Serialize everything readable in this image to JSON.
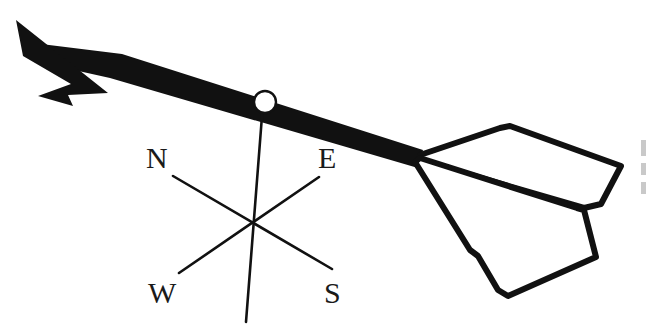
{
  "figure": {
    "background_color": "#ffffff",
    "ink_color": "#111111",
    "width": 649,
    "height": 328
  },
  "compass": {
    "center": {
      "x": 250,
      "y": 222
    },
    "labels": [
      {
        "id": "north",
        "text": "N",
        "x": 146,
        "y": 168
      },
      {
        "id": "east",
        "text": "E",
        "x": 318,
        "y": 168
      },
      {
        "id": "west",
        "text": "W",
        "x": 148,
        "y": 303
      },
      {
        "id": "south",
        "text": "S",
        "x": 324,
        "y": 303
      }
    ],
    "spokes": [
      {
        "id": "pole",
        "x1": 263,
        "y1": 103,
        "x2": 246,
        "y2": 322,
        "width": 2.6
      },
      {
        "id": "north-south-diagonal",
        "x1": 173,
        "y1": 176,
        "x2": 332,
        "y2": 269,
        "width": 2.6
      },
      {
        "id": "east-west-diagonal",
        "x1": 319,
        "y1": 177,
        "x2": 179,
        "y2": 273,
        "width": 2.6
      }
    ]
  },
  "arrow": {
    "shaft": {
      "points": "41,44 122,54 423,150 418,168 110,78 38,62",
      "color": "#111111"
    },
    "head": {
      "points": "16,20 108,93 68,95 73,106 38,96 71,84 23,56",
      "color": "#111111"
    },
    "pivot": {
      "cx": 265,
      "cy": 102,
      "r": 11,
      "fill": "#ffffff",
      "stroke": "#111111"
    },
    "fletching": {
      "top_plane": "420,155 500,128 510,126 621,166 601,204 584,208 420,160",
      "bottom_plane": "420,158 577,208 584,210 596,257 508,296 498,290 478,256 470,250 415,162",
      "stroke": "#111111",
      "stroke_width": 6
    }
  },
  "edge_artifacts": [
    {
      "id": "cut-text-fragment-top",
      "x": 641,
      "y": 140,
      "w": 5,
      "h": 16
    },
    {
      "id": "cut-text-fragment-middle",
      "x": 641,
      "y": 163,
      "w": 5,
      "h": 12
    },
    {
      "id": "cut-text-fragment-bottom",
      "x": 641,
      "y": 182,
      "w": 5,
      "h": 12
    }
  ]
}
